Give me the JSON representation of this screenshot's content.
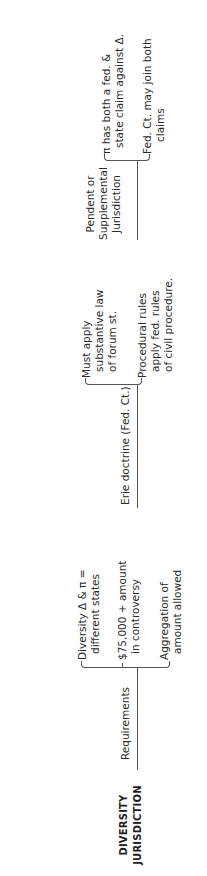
{
  "title": {
    "line1": "DIVERSITY",
    "line2": "JURISDICTION"
  },
  "branches": [
    {
      "label": "Requirements",
      "items": [
        {
          "lines": [
            "Diversity Δ & π =",
            "different states"
          ]
        },
        {
          "lines": [
            "$75,000 + amount",
            "in controversy"
          ]
        },
        {
          "lines": [
            "Aggregation of",
            "amount allowed"
          ]
        }
      ]
    },
    {
      "label": "Erie doctrine (Fed. Ct.)",
      "items": [
        {
          "lines": [
            "Must apply",
            "substantive law",
            "of forum st."
          ]
        },
        {
          "lines": [
            "Procedural rules",
            "apply fed. rules",
            "of civil procedure."
          ]
        }
      ]
    },
    {
      "label_lines": [
        "Pendent or",
        "Supplemental",
        "Jurisdiction"
      ],
      "items": [
        {
          "lines": [
            "π has both a fed. &",
            "state claim against Δ."
          ]
        },
        {
          "lines": [
            "Fed. Ct. may join both",
            "claims"
          ]
        }
      ]
    }
  ]
}
